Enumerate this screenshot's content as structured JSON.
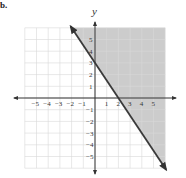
{
  "part_label": "b.",
  "chart_data": {
    "type": "line",
    "title": "",
    "xlabel": "",
    "ylabel": "y",
    "xlim": [
      -6,
      6
    ],
    "ylim": [
      -6,
      6
    ],
    "grid": true,
    "x_ticks": [
      -5,
      -4,
      -3,
      -2,
      -1,
      1,
      2,
      3,
      4,
      5
    ],
    "y_ticks": [
      -5,
      -4,
      -3,
      -2,
      -1,
      1,
      2,
      3,
      4,
      5
    ],
    "series": [
      {
        "name": "boundary line y = -3/2 x + 3",
        "style": "solid",
        "arrows": "both",
        "points": [
          [
            -2,
            6
          ],
          [
            0,
            3
          ],
          [
            2,
            0
          ],
          [
            6,
            -6
          ]
        ]
      }
    ],
    "shaded_region": {
      "description": "Region above/right of the line, y >= -3/2 x + 3",
      "color": "#c8c8c8"
    },
    "intercepts": {
      "x_intercept": 2,
      "y_intercept": 3
    }
  },
  "colors": {
    "shade": "#cccccc",
    "grid": "#d8d8d8",
    "axis": "#333333",
    "line": "#3a3a3a"
  }
}
